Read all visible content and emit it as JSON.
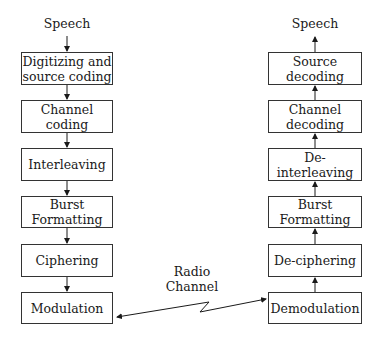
{
  "transmitter": {
    "input_label": "Speech",
    "blocks": [
      {
        "line1": "Digitizing and",
        "line2": "source coding"
      },
      {
        "line1": "Channel",
        "line2": "coding"
      },
      {
        "line1": "Interleaving",
        "line2": ""
      },
      {
        "line1": "Burst",
        "line2": "Formatting"
      },
      {
        "line1": "Ciphering",
        "line2": ""
      },
      {
        "line1": "Modulation",
        "line2": ""
      }
    ]
  },
  "receiver": {
    "output_label": "Speech",
    "blocks": [
      {
        "line1": "Source",
        "line2": "decoding"
      },
      {
        "line1": "Channel",
        "line2": "decoding"
      },
      {
        "line1": "De-interleaving",
        "line2": ""
      },
      {
        "line1": "Burst",
        "line2": "Formatting"
      },
      {
        "line1": "De-ciphering",
        "line2": ""
      },
      {
        "line1": "Demodulation",
        "line2": ""
      }
    ]
  },
  "channel": {
    "line1": "Radio",
    "line2": "Channel"
  }
}
